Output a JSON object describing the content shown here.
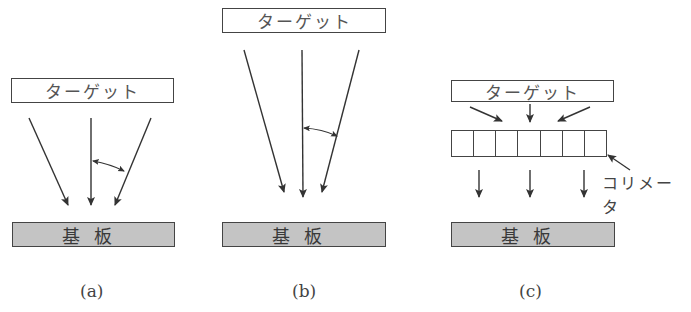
{
  "panels": [
    {
      "id": "a",
      "caption": "(a)",
      "target_label": "ターゲット",
      "substrate_label": "基板"
    },
    {
      "id": "b",
      "caption": "(b)",
      "target_label": "ターゲット",
      "substrate_label": "基板"
    },
    {
      "id": "c",
      "caption": "(c)",
      "target_label": "ターゲット",
      "substrate_label": "基板",
      "collimator_label": "コリメータ",
      "collimator_cells": 7
    }
  ],
  "colors": {
    "line": "#333333",
    "substrate_fill": "#c4c4c4",
    "background": "#ffffff"
  }
}
